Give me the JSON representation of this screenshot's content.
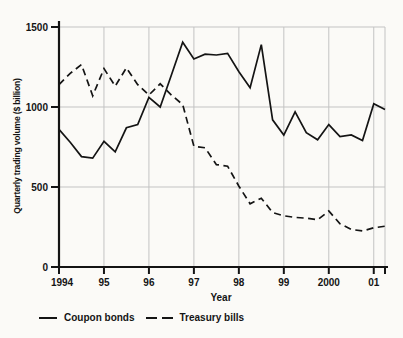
{
  "figure": {
    "y_axis_label": "Quarterly trading volume ($ billion)",
    "x_axis_label": "Year"
  },
  "legend": {
    "items": [
      {
        "label": "Coupon bonds",
        "style": "solid"
      },
      {
        "label": "Treasury bills",
        "style": "dashed"
      }
    ]
  },
  "colors": {
    "line": "#141414",
    "grid": "#c3c3c3",
    "text": "#141414",
    "background": "#fbfaf7"
  },
  "chart_data": {
    "type": "line",
    "title": "",
    "xlabel": "Year",
    "ylabel": "Quarterly trading volume ($ billion)",
    "x_frequency": "quarterly",
    "x_range": [
      1994.0,
      2001.25
    ],
    "ylim": [
      0,
      1500
    ],
    "grid": true,
    "legend_position": "bottom-left",
    "y_tick_values": [
      0,
      500,
      1000,
      1500
    ],
    "y_tick_labels": [
      "0",
      "500",
      "1000",
      "1500"
    ],
    "y_gridline_values": [
      500,
      1000,
      1500
    ],
    "x_tick_labels": [
      "1994",
      "95",
      "96",
      "97",
      "98",
      "99",
      "2000",
      "01"
    ],
    "x_tick_positions_quarters": [
      0,
      4,
      8,
      12,
      16,
      20,
      24,
      28
    ],
    "x_quarters": [
      "1994Q1",
      "1994Q2",
      "1994Q3",
      "1994Q4",
      "1995Q1",
      "1995Q2",
      "1995Q3",
      "1995Q4",
      "1996Q1",
      "1996Q2",
      "1996Q3",
      "1996Q4",
      "1997Q1",
      "1997Q2",
      "1997Q3",
      "1997Q4",
      "1998Q1",
      "1998Q2",
      "1998Q3",
      "1998Q4",
      "1999Q1",
      "1999Q2",
      "1999Q3",
      "1999Q4",
      "2000Q1",
      "2000Q2",
      "2000Q3",
      "2000Q4",
      "2001Q1",
      "2001Q2"
    ],
    "series": [
      {
        "name": "Coupon bonds",
        "line_style": "solid",
        "values": [
          860,
          780,
          690,
          680,
          785,
          720,
          870,
          890,
          1060,
          1000,
          1200,
          1405,
          1300,
          1330,
          1325,
          1335,
          1220,
          1120,
          1390,
          920,
          825,
          970,
          840,
          795,
          890,
          815,
          825,
          790,
          1020,
          985
        ]
      },
      {
        "name": "Treasury bills",
        "line_style": "dashed",
        "values": [
          1140,
          1210,
          1265,
          1070,
          1240,
          1130,
          1245,
          1140,
          1075,
          1145,
          1075,
          1015,
          755,
          745,
          640,
          630,
          505,
          395,
          430,
          340,
          320,
          310,
          305,
          295,
          350,
          270,
          235,
          225,
          245,
          255
        ]
      }
    ]
  }
}
